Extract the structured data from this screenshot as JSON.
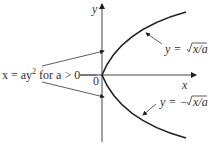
{
  "diagram": {
    "axis_y_label": "y",
    "axis_x_label": "x",
    "origin_label": "0",
    "left_label_a": "x = ay",
    "left_label_sup": "2",
    "left_label_b": " for a > 0",
    "upper_branch_label_prefix": "y = ",
    "upper_branch_radicand": "x/a",
    "lower_branch_label_prefix": "y = −",
    "lower_branch_radicand": "x/a",
    "colors": {
      "line": "#222222",
      "text": "#333333"
    }
  }
}
